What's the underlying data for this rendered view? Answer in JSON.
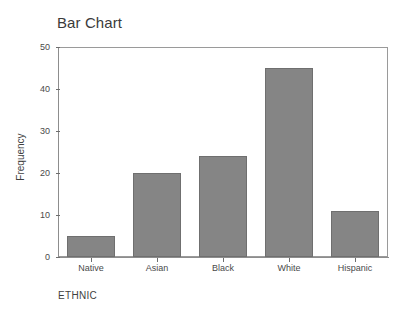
{
  "chart_data": {
    "type": "bar",
    "title": "Bar Chart",
    "xlabel": "ETHNIC",
    "ylabel": "Frequency",
    "categories": [
      "Native",
      "Asian",
      "Black",
      "White",
      "Hispanic"
    ],
    "values": [
      5,
      20,
      24,
      45,
      11
    ],
    "ylim": [
      0,
      50
    ],
    "yticks": [
      0,
      10,
      20,
      30,
      40,
      50
    ],
    "ytick_labels": [
      "0",
      "10",
      "20",
      "30",
      "40",
      "50"
    ],
    "grid": false,
    "legend": null,
    "bar_color": "#858585",
    "bar_edge_color": "#6f6f6f",
    "axis_color": "#8d8d8d",
    "background_color": "#ffffff",
    "text_color": "#3f3f3f"
  }
}
